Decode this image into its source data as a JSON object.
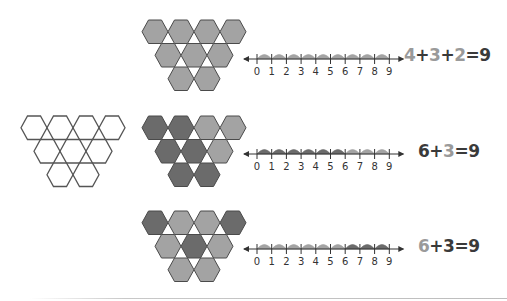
{
  "colors": {
    "light": "#a3a3a3",
    "dark": "#6b6b6b",
    "outline": "#4a4a4a",
    "empty": "#ffffff",
    "text_dark": "#3a3a3a",
    "text_light": "#9a9a9a"
  },
  "hex_layout": {
    "rows": [
      4,
      3,
      2
    ],
    "description": "Inverted triangle of 9 hexagons: 4 on top, 3 in middle, 2 on bottom"
  },
  "number_line": {
    "ticks": [
      "0",
      "1",
      "2",
      "3",
      "4",
      "5",
      "6",
      "7",
      "8",
      "9"
    ]
  },
  "examples": [
    {
      "id": "row-1",
      "hex_shades": [
        "light",
        "light",
        "light",
        "light",
        "light",
        "light",
        "light",
        "light",
        "light"
      ],
      "hop_shades": [
        "light",
        "light",
        "light",
        "light",
        "light",
        "light",
        "light",
        "light",
        "light"
      ],
      "equation": [
        {
          "text": "4",
          "shade": "light"
        },
        {
          "text": "+",
          "shade": "dark"
        },
        {
          "text": "3",
          "shade": "light"
        },
        {
          "text": "+",
          "shade": "dark"
        },
        {
          "text": "2",
          "shade": "light"
        },
        {
          "text": "=9",
          "shade": "dark"
        }
      ],
      "equation_text": "4+3+2=9"
    },
    {
      "id": "row-2",
      "outline_only_figure": true,
      "hex_shades": [
        "dark",
        "dark",
        "light",
        "light",
        "dark",
        "dark",
        "light",
        "dark",
        "dark"
      ],
      "hop_shades": [
        "dark",
        "dark",
        "dark",
        "dark",
        "dark",
        "dark",
        "light",
        "light",
        "light"
      ],
      "equation": [
        {
          "text": "6",
          "shade": "dark"
        },
        {
          "text": "+",
          "shade": "dark"
        },
        {
          "text": "3",
          "shade": "light"
        },
        {
          "text": "=9",
          "shade": "dark"
        }
      ],
      "equation_text": "6+3=9"
    },
    {
      "id": "row-3",
      "hex_shades": [
        "dark",
        "light",
        "light",
        "dark",
        "light",
        "dark",
        "light",
        "light",
        "light"
      ],
      "hop_shades": [
        "light",
        "light",
        "light",
        "light",
        "light",
        "light",
        "dark",
        "dark",
        "dark"
      ],
      "equation": [
        {
          "text": "6",
          "shade": "light"
        },
        {
          "text": "+",
          "shade": "dark"
        },
        {
          "text": "3",
          "shade": "dark"
        },
        {
          "text": "=9",
          "shade": "dark"
        }
      ],
      "equation_text": "6+3=9"
    }
  ]
}
